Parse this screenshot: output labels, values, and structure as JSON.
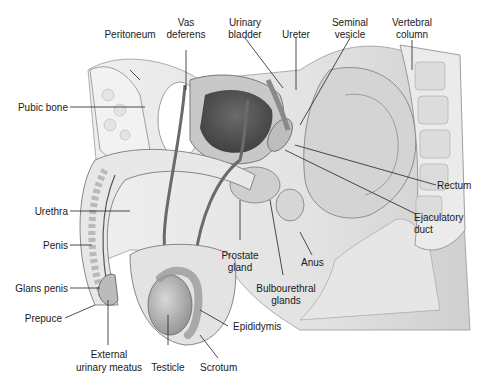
{
  "diagram": {
    "labels": {
      "peritoneum": "Peritoneum",
      "vas_deferens_1": "Vas",
      "vas_deferens_2": "deferens",
      "urinary_bladder_1": "Urinary",
      "urinary_bladder_2": "bladder",
      "ureter": "Ureter",
      "seminal_vesicle_1": "Seminal",
      "seminal_vesicle_2": "vesicle",
      "vertebral_column_1": "Vertebral",
      "vertebral_column_2": "column",
      "pubic_bone": "Pubic bone",
      "rectum": "Rectum",
      "urethra": "Urethra",
      "ejaculatory_duct_1": "Ejaculatory",
      "ejaculatory_duct_2": "duct",
      "penis": "Penis",
      "prostate_gland_1": "Prostate",
      "prostate_gland_2": "gland",
      "anus": "Anus",
      "glans_penis": "Glans penis",
      "bulbourethral_glands_1": "Bulbourethral",
      "bulbourethral_glands_2": "glands",
      "prepuce": "Prepuce",
      "epididymis": "Epididymis",
      "external_urinary_meatus_1": "External",
      "external_urinary_meatus_2": "urinary meatus",
      "testicle": "Testicle",
      "scrotum": "Scrotum"
    }
  }
}
